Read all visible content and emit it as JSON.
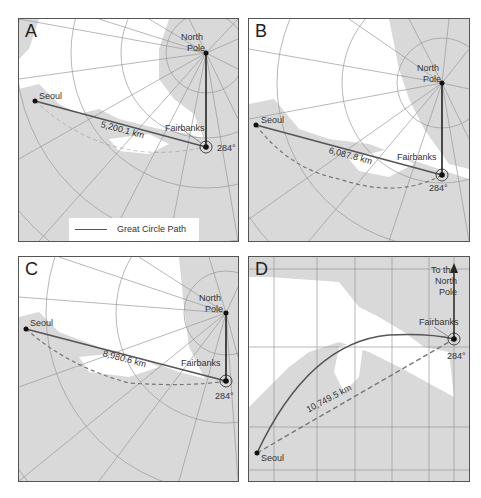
{
  "figure": {
    "panels": [
      {
        "id": "A",
        "letter": "A",
        "north_pole_label_1": "North",
        "north_pole_label_2": "Pole",
        "origin_label": "Seoul",
        "destination_label": "Fairbanks",
        "distance_label": "5,200.1 km",
        "bearing_label": "284°"
      },
      {
        "id": "B",
        "letter": "B",
        "north_pole_label_1": "North",
        "north_pole_label_2": "Pole",
        "origin_label": "Seoul",
        "destination_label": "Fairbanks",
        "distance_label": "6,087.8 km",
        "bearing_label": "284°"
      },
      {
        "id": "C",
        "letter": "C",
        "north_pole_label_1": "North",
        "north_pole_label_2": "Pole",
        "origin_label": "Seoul",
        "destination_label": "Fairbanks",
        "distance_label": "8,980.6 km",
        "bearing_label": "284°"
      },
      {
        "id": "D",
        "letter": "D",
        "north_pole_label_1": "To the",
        "north_pole_label_2": "North",
        "north_pole_label_3": "Pole",
        "origin_label": "Seoul",
        "destination_label": "Fairbanks",
        "distance_label": "10,749.5 km",
        "bearing_label": "284°"
      }
    ],
    "legend": {
      "great_circle_label": "Great Circle Path",
      "rhumb_line_label": "Rhumb Line"
    },
    "colors": {
      "land": "#d9d9d9",
      "water": "#ffffff",
      "graticule": "#9a9a9a",
      "great_circle": "#555555",
      "rhumb_line": "#777777",
      "pole_line": "#222222",
      "border": "#555555"
    }
  }
}
